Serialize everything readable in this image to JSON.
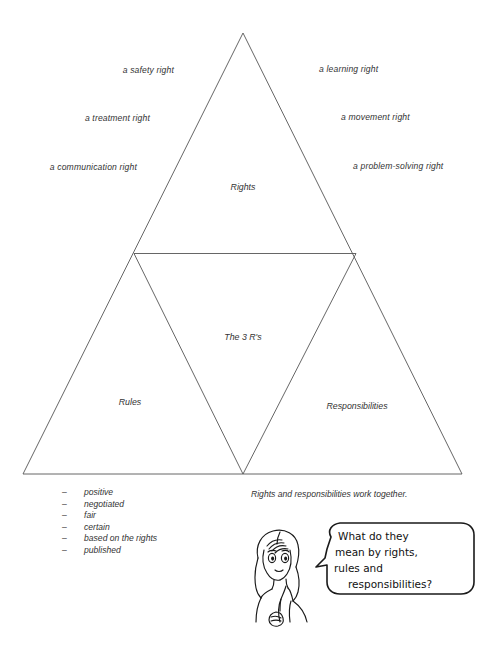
{
  "diagram": {
    "title_zones": {
      "top": "Rights",
      "center": "The 3 R's",
      "bottom_left": "Rules",
      "bottom_right": "Responsibilities"
    },
    "left_labels": [
      "a safety right",
      "a treatment right",
      "a communication right"
    ],
    "right_labels": [
      "a learning right",
      "a movement right",
      "a problem-solving right"
    ],
    "line_color": "#555555",
    "text_color": "#333333"
  },
  "rules_list": {
    "bullet": "–",
    "items": [
      "positive",
      "negotiated",
      "fair",
      "certain",
      "based on the rights",
      "published"
    ]
  },
  "caption": "Rights and responsibilities work together.",
  "speech_bubble": {
    "lines": [
      "What do they",
      "mean by rights,",
      "rules and",
      "responsibilities?"
    ],
    "full_text": "What do they mean by rights, rules and responsibilities?"
  }
}
